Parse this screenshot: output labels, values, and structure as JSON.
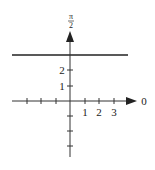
{
  "diagram": {
    "type": "polar-coordinate-axes",
    "horizontal_line": {
      "description": "line r*sin(theta)=const above pole",
      "y_value": 2.5
    },
    "axis_labels": {
      "polar_axis": "0",
      "vertical_axis_num": "π",
      "vertical_axis_den": "2"
    },
    "x_tick_labels": [
      "1",
      "2",
      "3"
    ],
    "y_tick_labels": [
      "1",
      "2"
    ],
    "colors": {
      "stroke": "#222222",
      "background": "#ffffff"
    }
  }
}
